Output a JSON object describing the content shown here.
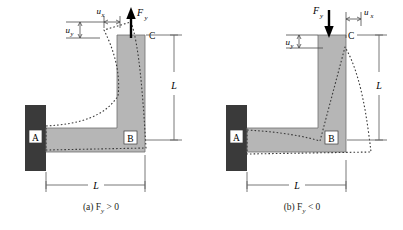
{
  "figure": {
    "colors": {
      "beam_fill": "#b6b6b6",
      "beam_stroke": "#6e6e6e",
      "wall_fill": "#3a3a3a",
      "dashed": "#3a3a3a",
      "dimension": "#6a6a6a",
      "arrow": "#000000",
      "text": "#231f20",
      "background": "#ffffff"
    }
  },
  "panels": [
    {
      "id": "a",
      "caption": "(a) F",
      "caption_sub": "y",
      "caption_rel": " > 0",
      "force": {
        "label": "F",
        "sub": "y",
        "direction": "up",
        "sign": "positive"
      },
      "displacements": [
        {
          "name": "u",
          "sub": "x",
          "orientation": "horizontal",
          "position": "top-left-of-force"
        },
        {
          "name": "u",
          "sub": "y",
          "orientation": "vertical",
          "position": "left"
        }
      ],
      "nodes": [
        {
          "label": "A",
          "role": "fixed-support"
        },
        {
          "label": "B",
          "role": "corner"
        },
        {
          "label": "C",
          "role": "free-end"
        }
      ],
      "dimensions": [
        {
          "label": "L",
          "orientation": "vertical",
          "side": "right",
          "member": "vertical-member"
        },
        {
          "label": "L",
          "orientation": "horizontal",
          "side": "bottom",
          "member": "horizontal-member"
        }
      ]
    },
    {
      "id": "b",
      "caption": "(b) F",
      "caption_sub": "y",
      "caption_rel": " < 0",
      "force": {
        "label": "F",
        "sub": "y",
        "direction": "down",
        "sign": "negative"
      },
      "displacements": [
        {
          "name": "u",
          "sub": "x",
          "orientation": "horizontal",
          "position": "top-right-of-force"
        },
        {
          "name": "u",
          "sub": "y",
          "orientation": "vertical",
          "position": "left"
        }
      ],
      "nodes": [
        {
          "label": "A",
          "role": "fixed-support"
        },
        {
          "label": "B",
          "role": "corner"
        },
        {
          "label": "C",
          "role": "free-end"
        }
      ],
      "dimensions": [
        {
          "label": "L",
          "orientation": "vertical",
          "side": "right",
          "member": "vertical-member"
        },
        {
          "label": "L",
          "orientation": "horizontal",
          "side": "bottom",
          "member": "horizontal-member"
        }
      ]
    }
  ]
}
